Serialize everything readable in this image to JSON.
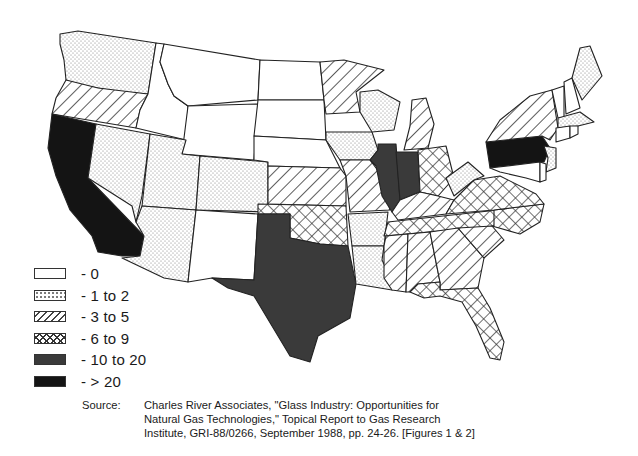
{
  "map": {
    "title": "Glass industry plants by state (United States)",
    "categories": [
      {
        "id": "c0",
        "label": "- 0",
        "fill": "#ffffff"
      },
      {
        "id": "c1",
        "label": "- 1 to 2",
        "fill": "dots"
      },
      {
        "id": "c2",
        "label": "- 3 to 5",
        "fill": "diagonal-hatch"
      },
      {
        "id": "c3",
        "label": "- 6 to 9",
        "fill": "cross-hatch"
      },
      {
        "id": "c4",
        "label": "- 10 to 20",
        "fill": "#3a3a3a"
      },
      {
        "id": "c5",
        "label": "- > 20",
        "fill": "#141414"
      }
    ],
    "states": {
      "WA": "1 to 2",
      "OR": "3 to 5",
      "CA": "> 20",
      "ID": "0",
      "NV": "1 to 2",
      "MT": "0",
      "WY": "0",
      "UT": "1 to 2",
      "AZ": "1 to 2",
      "CO": "1 to 2",
      "NM": "0",
      "ND": "0",
      "SD": "0",
      "NE": "0",
      "KS": "3 to 5",
      "OK": "6 to 9",
      "TX": "10 to 20",
      "MN": "3 to 5",
      "IA": "1 to 2",
      "MO": "3 to 5",
      "AR": "1 to 2",
      "LA": "1 to 2",
      "WI": "1 to 2",
      "IL": "10 to 20",
      "IN": "10 to 20",
      "MI": "3 to 5",
      "OH": "6 to 9",
      "KY": "3 to 5",
      "TN": "6 to 9",
      "MS": "3 to 5",
      "AL": "3 to 5",
      "GA": "3 to 5",
      "FL": "6 to 9",
      "SC": "3 to 5",
      "NC": "6 to 9",
      "VA": "6 to 9",
      "WV": "1 to 2",
      "PA": "> 20",
      "NY": "3 to 5",
      "NJ": "1 to 2",
      "MD": "0",
      "DE": "0",
      "CT": "0",
      "RI": "0",
      "MA": "1 to 2",
      "VT": "0",
      "NH": "0",
      "ME": "1 to 2"
    }
  },
  "legend": {
    "items": [
      "- 0",
      "- 1 to 2",
      "- 3 to 5",
      "- 6 to 9",
      "- 10 to 20",
      "- > 20"
    ]
  },
  "source": {
    "label": "Source:",
    "line1": "Charles River Associates, \"Glass Industry: Opportunities for",
    "line2": "Natural Gas Technologies,\" Topical Report to Gas Research",
    "line3": "Institute, GRI-88/0266, September 1988, pp. 24-26. [Figures 1 & 2]"
  }
}
